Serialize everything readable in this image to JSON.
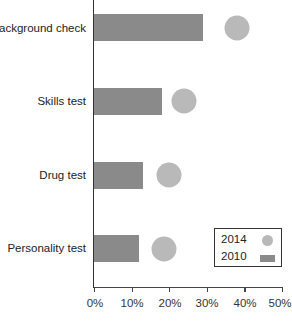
{
  "chart_data": {
    "type": "bar",
    "orientation": "horizontal",
    "title": "",
    "xlabel": "",
    "ylabel": "",
    "categories": [
      "Background check",
      "Skills test",
      "Drug test",
      "Personality test"
    ],
    "series": [
      {
        "name": "2010",
        "marker": "bar",
        "color": "#8a8a8a",
        "values": [
          29,
          18,
          13,
          12
        ]
      },
      {
        "name": "2014",
        "marker": "circle",
        "color": "#b9b9b9",
        "values": [
          38,
          24,
          20,
          18.5
        ]
      }
    ],
    "xlim": [
      0,
      50
    ],
    "xticks": [
      "0%",
      "10%",
      "20%",
      "30%",
      "40%",
      "50%"
    ],
    "grid": false,
    "legend": {
      "position": "lower right",
      "entries": [
        "2014",
        "2010"
      ]
    }
  },
  "labels": {
    "cat0": "Background check",
    "cat1": "Skills test",
    "cat2": "Drug test",
    "cat3": "Personality test"
  },
  "ticks": {
    "t0": "0%",
    "t1": "10%",
    "t2": "20%",
    "t3": "30%",
    "t4": "40%",
    "t5": "50%"
  },
  "legend": {
    "y2014": "2014",
    "y2010": "2010"
  }
}
